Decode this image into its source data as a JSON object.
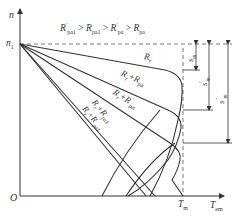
{
  "diagram": {
    "type": "mechanical characteristic curves (speed vs electromagnetic torque)",
    "condition": {
      "text": "R'pa1 > Rpa1 > R'pa > Rpa",
      "parts": [
        {
          "base": "R",
          "sub": "pa1",
          "prime": true
        },
        {
          "op": ">"
        },
        {
          "base": "R",
          "sub": "pa1",
          "prime": false
        },
        {
          "op": ">"
        },
        {
          "base": "R",
          "sub": "pa",
          "prime": true
        },
        {
          "op": ">"
        },
        {
          "base": "R",
          "sub": "pa",
          "prime": false
        }
      ]
    },
    "axes": {
      "y_label": "n",
      "x_label_base": "T",
      "x_label_sub": "em",
      "origin": "O",
      "n1_base": "n",
      "n1_sub": "1",
      "tm_base": "T",
      "tm_sub": "m"
    },
    "curves": [
      {
        "id": "Rr",
        "label_base": "R",
        "label_sub": "r"
      },
      {
        "id": "Rr+Rpa",
        "label_base": "R",
        "label_sub": "r",
        "plus": "+R",
        "plus_sub": "pa",
        "prime": false
      },
      {
        "id": "Rr+R'pa",
        "label_base": "R",
        "label_sub": "r",
        "plus": "+R",
        "plus_sub": "pa",
        "prime": true
      },
      {
        "id": "Rr+Rpa1",
        "label_base": "R",
        "label_sub": "r",
        "plus": "+R",
        "plus_sub": "pa1",
        "prime": false
      },
      {
        "id": "Rr+R'pa1",
        "label_base": "R",
        "label_sub": "r",
        "plus": "+R",
        "plus_sub": "pa1",
        "prime": true
      }
    ],
    "slips": [
      {
        "base": "s",
        "sub": "m",
        "prime": ""
      },
      {
        "base": "s",
        "sub": "m",
        "prime": "′"
      },
      {
        "base": "s",
        "sub": "m",
        "prime": "″"
      }
    ],
    "colors": {
      "line": "#333333",
      "dashed": "#555555",
      "background": "#ffffff"
    }
  }
}
